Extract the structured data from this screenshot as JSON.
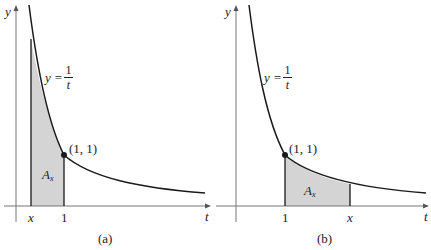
{
  "panels": [
    {
      "id": "a",
      "caption": "(a)",
      "y_axis_label": "y",
      "t_axis_label": "t",
      "curve_eq_lhs": "y =",
      "curve_num": "1",
      "curve_den": "t",
      "point_label": "(1, 1)",
      "area_label": "A",
      "area_sub": "x",
      "tick_left": "x",
      "tick_right": "1"
    },
    {
      "id": "b",
      "caption": "(b)",
      "y_axis_label": "y",
      "t_axis_label": "t",
      "curve_eq_lhs": "y =",
      "curve_num": "1",
      "curve_den": "t",
      "point_label": "(1, 1)",
      "area_label": "A",
      "area_sub": "x",
      "tick_left": "1",
      "tick_right": "x"
    }
  ],
  "colors": {
    "curve": "#1a1a1a",
    "shade": "#d4d4d4",
    "axis": "#777777"
  }
}
